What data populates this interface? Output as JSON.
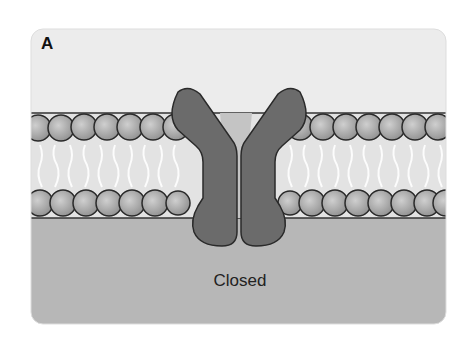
{
  "figure": {
    "panel_label": "A",
    "caption": "Closed",
    "colors": {
      "extracellular": "#ececec",
      "intracellular": "#b5b5b5",
      "membrane_core": "#e2e2e2",
      "lipid_head": "#a9a9a9",
      "lipid_outline": "#2a2a2a",
      "channel_protein": "#6b6b6b",
      "pore": "#c4c4c4"
    },
    "parts": [
      "lipid bilayer",
      "ion channel protein (two subunits)",
      "closed pore"
    ]
  }
}
